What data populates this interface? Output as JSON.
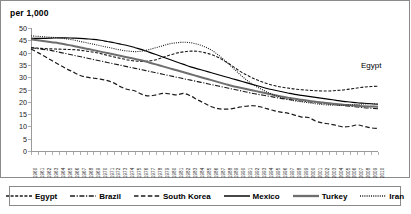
{
  "chart_data": {
    "type": "line",
    "title": "",
    "ylabel": "per 1,000",
    "xlabel": "",
    "ylim": [
      0,
      50
    ],
    "ytick_step": 5,
    "yticks": [
      0,
      5,
      10,
      15,
      20,
      25,
      30,
      35,
      40,
      45,
      50
    ],
    "grid": false,
    "legend_position": "bottom",
    "x": [
      1960,
      1961,
      1962,
      1963,
      1964,
      1965,
      1966,
      1967,
      1968,
      1969,
      1970,
      1971,
      1972,
      1973,
      1974,
      1975,
      1976,
      1977,
      1978,
      1979,
      1980,
      1981,
      1982,
      1983,
      1984,
      1985,
      1986,
      1987,
      1988,
      1989,
      1990,
      1991,
      1992,
      1993,
      1994,
      1995,
      1996,
      1997,
      1998,
      1999,
      2000,
      2001,
      2002,
      2003,
      2004,
      2005,
      2006,
      2007,
      2008,
      2009,
      2010
    ],
    "annotations": [
      {
        "text": "Egypt",
        "x": 2003,
        "y": 37
      }
    ],
    "series": [
      {
        "name": "Egypt",
        "style": "dotted-coarse",
        "color": "#1a1a1a",
        "values": [
          42.0,
          41.8,
          41.6,
          41.5,
          41.4,
          41.3,
          41.2,
          41.0,
          40.6,
          40.2,
          39.6,
          38.9,
          38.2,
          37.6,
          37.0,
          36.6,
          36.4,
          36.6,
          37.1,
          38.0,
          39.0,
          39.8,
          40.3,
          40.6,
          40.5,
          40.0,
          39.2,
          38.0,
          36.4,
          34.6,
          32.6,
          31.0,
          29.6,
          28.4,
          27.4,
          26.6,
          26.0,
          25.6,
          25.2,
          24.9,
          24.7,
          24.5,
          24.4,
          24.4,
          24.6,
          24.8,
          25.2,
          25.6,
          26.0,
          26.2,
          26.3
        ]
      },
      {
        "name": "Brazil",
        "style": "dash-dot",
        "color": "#1a1a1a",
        "values": [
          42.0,
          41.6,
          41.2,
          40.8,
          40.2,
          39.6,
          39.0,
          38.4,
          37.8,
          37.2,
          36.6,
          36.0,
          35.4,
          34.8,
          34.2,
          33.6,
          33.0,
          32.4,
          31.8,
          31.2,
          30.6,
          30.0,
          29.4,
          28.8,
          28.2,
          27.6,
          27.0,
          26.4,
          25.8,
          25.2,
          24.6,
          24.0,
          23.4,
          22.9,
          22.4,
          21.9,
          21.4,
          21.0,
          20.6,
          20.3,
          20.0,
          19.7,
          19.4,
          19.1,
          18.8,
          18.5,
          18.2,
          17.9,
          17.6,
          17.4,
          17.2
        ]
      },
      {
        "name": "South Korea",
        "style": "dashed",
        "color": "#1a1a1a",
        "values": [
          41.5,
          40.0,
          38.4,
          36.8,
          35.2,
          33.6,
          32.2,
          30.8,
          30.0,
          29.6,
          29.2,
          28.6,
          27.6,
          26.0,
          25.0,
          24.4,
          23.0,
          22.4,
          22.8,
          23.4,
          23.2,
          22.8,
          23.4,
          22.4,
          20.8,
          19.4,
          18.0,
          17.2,
          17.0,
          17.2,
          17.8,
          18.2,
          18.4,
          18.0,
          17.2,
          16.4,
          15.8,
          15.4,
          14.6,
          13.8,
          13.6,
          12.2,
          11.4,
          11.0,
          10.4,
          9.8,
          10.0,
          10.6,
          10.0,
          9.4,
          9.2
        ]
      },
      {
        "name": "Mexico",
        "style": "solid-thin",
        "color": "#000000",
        "values": [
          45.8,
          45.8,
          45.8,
          45.9,
          46.0,
          46.0,
          45.9,
          45.8,
          45.6,
          45.4,
          45.0,
          44.5,
          44.0,
          43.4,
          42.8,
          42.0,
          41.2,
          40.2,
          39.2,
          38.2,
          37.2,
          36.2,
          35.2,
          34.2,
          33.4,
          32.6,
          31.8,
          31.0,
          30.2,
          29.4,
          28.6,
          27.8,
          27.0,
          26.2,
          25.4,
          24.8,
          24.2,
          23.6,
          23.0,
          22.6,
          22.2,
          21.8,
          21.4,
          21.0,
          20.6,
          20.2,
          19.9,
          19.6,
          19.4,
          19.2,
          19.0
        ]
      },
      {
        "name": "Turkey",
        "style": "solid-thick",
        "color": "#6e6e6e",
        "values": [
          45.4,
          45.0,
          44.6,
          44.2,
          43.8,
          43.3,
          42.8,
          42.2,
          41.6,
          41.0,
          40.4,
          39.8,
          39.2,
          38.6,
          38.0,
          37.4,
          36.8,
          36.0,
          35.2,
          34.4,
          33.6,
          32.8,
          32.0,
          31.2,
          30.4,
          29.6,
          28.8,
          28.0,
          27.2,
          26.4,
          25.8,
          25.2,
          24.6,
          24.0,
          23.4,
          22.8,
          22.2,
          21.7,
          21.2,
          20.8,
          20.4,
          20.0,
          19.7,
          19.4,
          19.1,
          18.8,
          18.6,
          18.4,
          18.2,
          18.1,
          18.0
        ]
      },
      {
        "name": "Iran",
        "style": "dotted-fine",
        "color": "#1a1a1a",
        "values": [
          46.8,
          46.6,
          46.4,
          46.2,
          46.0,
          45.6,
          45.2,
          44.6,
          44.0,
          43.4,
          42.8,
          42.2,
          41.6,
          41.0,
          40.6,
          40.4,
          40.6,
          41.2,
          42.0,
          42.8,
          43.6,
          44.0,
          44.2,
          44.0,
          43.4,
          42.4,
          41.0,
          39.0,
          36.6,
          34.0,
          31.4,
          29.0,
          27.0,
          25.4,
          24.0,
          22.8,
          21.8,
          21.0,
          20.4,
          20.0,
          19.6,
          19.2,
          18.9,
          18.7,
          18.6,
          18.6,
          18.7,
          18.9,
          19.1,
          19.2,
          19.2
        ]
      }
    ]
  },
  "legend": {
    "items": [
      {
        "label": "Egypt",
        "style": "dotted-coarse"
      },
      {
        "label": "Brazil",
        "style": "dash-dot"
      },
      {
        "label": "South Korea",
        "style": "dashed"
      },
      {
        "label": "Mexico",
        "style": "solid-thin"
      },
      {
        "label": "Turkey",
        "style": "solid-thick"
      },
      {
        "label": "Iran",
        "style": "dotted-fine"
      }
    ]
  }
}
